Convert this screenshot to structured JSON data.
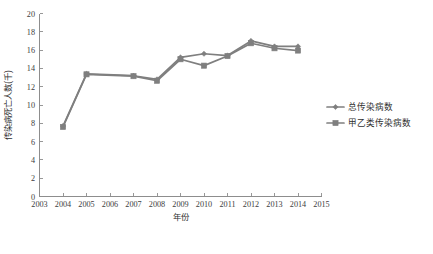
{
  "chart_data": {
    "type": "line",
    "title": "",
    "xlabel": "年份",
    "ylabel": "传染病死亡人数(千)",
    "x": [
      2004,
      2005,
      2007,
      2008,
      2009,
      2010,
      2011,
      2012,
      2013,
      2014
    ],
    "xlim": [
      2003,
      2015
    ],
    "ylim": [
      0,
      20
    ],
    "xticks": [
      2003,
      2004,
      2005,
      2006,
      2007,
      2008,
      2009,
      2010,
      2011,
      2012,
      2013,
      2014,
      2015
    ],
    "yticks": [
      0,
      2,
      4,
      6,
      8,
      10,
      12,
      14,
      16,
      18,
      20
    ],
    "grid": false,
    "legend_position": "right",
    "series": [
      {
        "name": "总传染病数",
        "marker": "diamond",
        "color": "#7f7f7f",
        "values": [
          7.7,
          13.4,
          13.2,
          12.8,
          15.2,
          15.6,
          15.4,
          17.0,
          16.4,
          16.4
        ]
      },
      {
        "name": "甲乙类传染病数",
        "marker": "square",
        "color": "#7f7f7f",
        "values": [
          7.6,
          13.35,
          13.15,
          12.65,
          15.0,
          14.3,
          15.35,
          16.75,
          16.2,
          15.95
        ]
      }
    ]
  },
  "colors": {
    "axis": "#8d8d8d",
    "series": "#7f7f7f",
    "text": "#3a3a3a",
    "background": "#ffffff"
  }
}
